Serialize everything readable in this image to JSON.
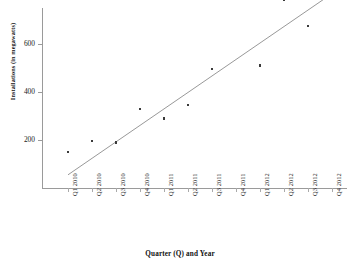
{
  "chart_data": {
    "type": "scatter",
    "title": "",
    "xlabel": "Quarter (Q) and Year",
    "ylabel": "Installations (in megawatts)",
    "categories": [
      "Q1 2010",
      "Q2 2010",
      "Q3 2010",
      "Q4 2010",
      "Q1 2011",
      "Q2 2011",
      "Q3 2011",
      "Q4 2011",
      "Q1 2012",
      "Q2 2012",
      "Q3 2012",
      "Q4 2012"
    ],
    "series": [
      {
        "name": "Installations",
        "values": [
          150,
          195,
          190,
          330,
          290,
          345,
          495,
          790,
          510,
          785,
          675,
          null
        ]
      }
    ],
    "trendline": {
      "present": true,
      "type": "linear",
      "start": {
        "category": "Q1 2010",
        "value": 55
      },
      "end": {
        "category": "Q4 2012",
        "value": 810
      }
    },
    "yticks": [
      200,
      400,
      600,
      800
    ],
    "ylim": [
      0,
      860
    ],
    "grid": false,
    "legend": false,
    "marker": "small-filled-square",
    "marker_color": "#3a3a3a",
    "trendline_color": "#8c8c8c",
    "axis_color": "#9a9a9a"
  },
  "axes": {
    "y_title": "Installations (in megawatts)",
    "x_title": "Quarter (Q) and Year",
    "y_tick_labels": [
      "800",
      "600",
      "400",
      "200"
    ],
    "x_tick_labels": [
      "Q1 2010",
      "Q2 2010",
      "Q3 2010",
      "Q4 2010",
      "Q1 2011",
      "Q2 2011",
      "Q3 2011",
      "Q4 2011",
      "Q1 2012",
      "Q2 2012",
      "Q3 2012",
      "Q4 2012"
    ]
  }
}
